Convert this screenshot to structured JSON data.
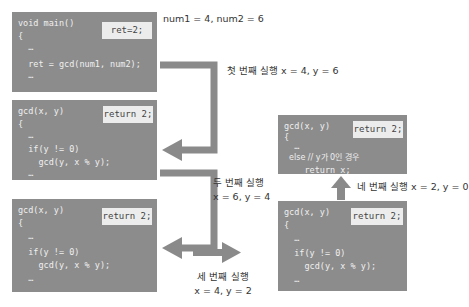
{
  "diagram": {
    "title_note": "num1 = 4, num2 = 6",
    "boxes": [
      {
        "id": "main",
        "lines": [
          "void main()",
          "{",
          "  …",
          "",
          "  ret = gcd(num1, num2);",
          "  …"
        ],
        "badge": "ret=2;"
      },
      {
        "id": "gcd-call-1",
        "lines": [
          "gcd(x, y)",
          "{",
          "  …",
          "",
          "  if(y != 0)",
          "    gcd(y, x % y);",
          "  …"
        ],
        "badge": "return 2;"
      },
      {
        "id": "gcd-call-2",
        "lines": [
          "gcd(x, y)",
          "{",
          "  …",
          "",
          "  if(y != 0)",
          "    gcd(y, x % y);",
          "  …"
        ],
        "badge": "return 2;"
      },
      {
        "id": "gcd-call-3",
        "lines": [
          "gcd(x, y)",
          "{",
          "  …",
          "",
          "  if(y != 0)",
          "    gcd(y, x % y);",
          "  …"
        ],
        "badge": "return 2;"
      },
      {
        "id": "gcd-call-4",
        "lines": [
          "gcd(x, y)",
          "{",
          "  …",
          "  else // y가 0인 경우",
          "    return x;"
        ],
        "badge": "return 2;"
      }
    ],
    "steps": [
      {
        "label": "첫 번째 실행 x = 4, y = 6"
      },
      {
        "label_line1": "두 번째 실행",
        "label_line2": "x = 6, y = 4"
      },
      {
        "label_line1": "세 번째 실행",
        "label_line2": "x = 4, y = 2"
      },
      {
        "label": "네 번째 실행 x = 2, y = 0"
      }
    ],
    "colors": {
      "box_bg": "#8c8c8c",
      "box_text": "#f0f0f0",
      "badge_bg": "#ececec",
      "arrow": "#8a8a8a",
      "label_text": "#333333"
    }
  }
}
